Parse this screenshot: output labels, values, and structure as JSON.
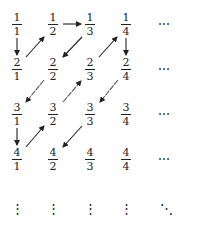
{
  "diagram": {
    "title": "",
    "grid": {
      "rows": [
        [
          {
            "num": "1",
            "den": "1"
          },
          {
            "num": "1",
            "den": "2"
          },
          {
            "num": "1",
            "den": "3"
          },
          {
            "num": "1",
            "den": "4"
          }
        ],
        [
          {
            "num": "2",
            "den": "1"
          },
          {
            "num": "2",
            "den": "2"
          },
          {
            "num": "2",
            "den": "3"
          },
          {
            "num": "2",
            "den": "4"
          }
        ],
        [
          {
            "num": "3",
            "den": "1"
          },
          {
            "num": "3",
            "den": "2"
          },
          {
            "num": "3",
            "den": "3"
          },
          {
            "num": "3",
            "den": "4"
          }
        ],
        [
          {
            "num": "4",
            "den": "1"
          },
          {
            "num": "4",
            "den": "2"
          },
          {
            "num": "4",
            "den": "3"
          },
          {
            "num": "4",
            "den": "4"
          }
        ]
      ],
      "row_continuation": "⋯",
      "col_continuation": "⋮",
      "diag_continuation": "⋱"
    },
    "arrows": [
      {
        "from": "1/1",
        "to": "2/1"
      },
      {
        "from": "2/1",
        "to": "1/2"
      },
      {
        "from": "1/2",
        "to": "1/3"
      },
      {
        "from": "1/3",
        "to": "2/2"
      },
      {
        "from": "2/2",
        "to": "3/1"
      },
      {
        "from": "3/1",
        "to": "4/1"
      },
      {
        "from": "4/1",
        "to": "3/2"
      },
      {
        "from": "3/2",
        "to": "2/3"
      },
      {
        "from": "2/3",
        "to": "1/4"
      },
      {
        "from": "1/4",
        "to": "2/4"
      },
      {
        "from": "2/4",
        "to": "3/3"
      },
      {
        "from": "3/3",
        "to": "4/2"
      }
    ],
    "colors": {
      "ink": "#222222",
      "background": "#ffffff"
    }
  }
}
